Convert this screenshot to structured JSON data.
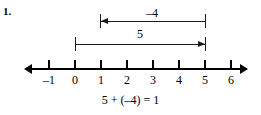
{
  "problem": {
    "number_label": "1.",
    "equation": "5 + (–4) = 1"
  },
  "number_line": {
    "ticks": [
      {
        "value": -1,
        "label": "–1",
        "x": 49
      },
      {
        "value": 0,
        "label": "0",
        "x": 75
      },
      {
        "value": 1,
        "label": "1",
        "x": 101
      },
      {
        "value": 2,
        "label": "2",
        "x": 127
      },
      {
        "value": 3,
        "label": "3",
        "x": 153
      },
      {
        "value": 4,
        "label": "4",
        "x": 179
      },
      {
        "value": 5,
        "label": "5",
        "x": 205
      },
      {
        "value": 6,
        "label": "6",
        "x": 231
      }
    ],
    "left_arrow_name": "axis-arrow-left",
    "right_arrow_name": "axis-arrow-right"
  },
  "jumps": [
    {
      "label": "–4",
      "from_value": 5,
      "to_value": 1,
      "direction": "left",
      "start_x": 205,
      "end_x": 100,
      "line_y": 21,
      "label_x": 152,
      "label_y": 7
    },
    {
      "label": "5",
      "from_value": 0,
      "to_value": 5,
      "direction": "right",
      "start_x": 75,
      "end_x": 205,
      "line_y": 44,
      "label_x": 140,
      "label_y": 28
    }
  ],
  "colors": {
    "ink": "#000000",
    "line": "#1a1a1a",
    "background": "#ffffff"
  }
}
